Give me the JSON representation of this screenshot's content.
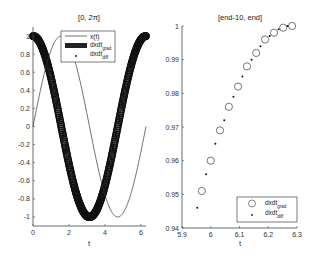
{
  "chart_data": [
    {
      "type": "line",
      "title": "[0, 2π]",
      "xlabel": "t",
      "ylabel": "",
      "xlim": [
        0,
        6.2832
      ],
      "ylim": [
        -1.1,
        1.1
      ],
      "xticks": [
        "0",
        "2",
        "4",
        "6"
      ],
      "yticks": [
        "-1",
        "-0.8",
        "-0.6",
        "-0.4",
        "-0.2",
        "0",
        "0.2",
        "0.4",
        "0.6",
        "0.8",
        "1"
      ],
      "grid": false,
      "legend_position": "northeast-inside",
      "series": [
        {
          "name": "x(t)",
          "style": "thin line",
          "function": "sin(t)",
          "x_range": [
            0,
            6.2832
          ]
        },
        {
          "name": "dxdt_grad",
          "style": "dense open circles (appears as thick band)",
          "function": "cos(t)",
          "x_range": [
            0,
            6.2832
          ]
        },
        {
          "name": "dxdt_diff",
          "style": "dot markers",
          "function": "cos(t)",
          "x_range": [
            0,
            6.2832
          ]
        }
      ]
    },
    {
      "type": "scatter",
      "title": "[end-10, end]",
      "xlabel": "t",
      "ylabel": "",
      "xlim": [
        5.9,
        6.3
      ],
      "ylim": [
        0.94,
        1.0
      ],
      "xticks": [
        "5.9",
        "6",
        "6.1",
        "6.2",
        "6.3"
      ],
      "yticks": [
        "0.94",
        "0.95",
        "0.96",
        "0.97",
        "0.98",
        "0.99",
        "1"
      ],
      "grid": false,
      "legend_position": "southeast-inside",
      "series": [
        {
          "name": "dxdt_grad",
          "marker": "open circle",
          "x": [
            5.969,
            6.0,
            6.032,
            6.063,
            6.095,
            6.126,
            6.158,
            6.189,
            6.22,
            6.252,
            6.283
          ],
          "y": [
            0.951,
            0.96,
            0.969,
            0.976,
            0.982,
            0.988,
            0.992,
            0.996,
            0.998,
            0.9995,
            1.0
          ]
        },
        {
          "name": "dxdt_diff",
          "marker": "dot",
          "x": [
            5.953,
            5.984,
            6.016,
            6.047,
            6.079,
            6.11,
            6.142,
            6.173,
            6.205,
            6.236,
            6.267
          ],
          "y": [
            0.946,
            0.956,
            0.965,
            0.972,
            0.979,
            0.985,
            0.99,
            0.994,
            0.997,
            0.999,
            1.0
          ]
        }
      ]
    }
  ],
  "left": {
    "title": "[0, 2π]",
    "xlabel": "t",
    "xticks": [
      "0",
      "2",
      "4",
      "6"
    ],
    "yticks": [
      "1",
      "0.8",
      "0.6",
      "0.4",
      "0.2",
      "0",
      "-0.2",
      "-0.4",
      "-0.6",
      "-0.8",
      "-1"
    ],
    "legend": {
      "x": "x(t)",
      "grad_main": "dxdt",
      "grad_sub": "grad",
      "diff_main": "dxdt",
      "diff_sub": "diff"
    }
  },
  "right": {
    "title": "[end-10, end]",
    "xlabel": "t",
    "xticks": [
      "5.9",
      "6",
      "6.1",
      "6.2",
      "6.3"
    ],
    "yticks": [
      "1",
      "0.99",
      "0.98",
      "0.97",
      "0.96",
      "0.95",
      "0.94"
    ],
    "legend": {
      "grad_main": "dxdt",
      "grad_sub": "grad",
      "diff_main": "dxdt",
      "diff_sub": "diff"
    }
  }
}
